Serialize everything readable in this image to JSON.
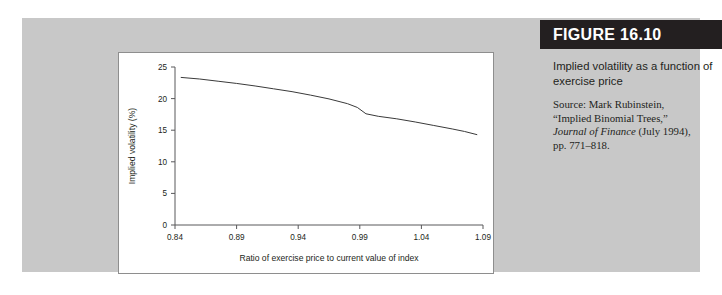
{
  "figure": {
    "header_label": "FIGURE 16.10",
    "caption_title": "Implied volatility as a function of exercise price",
    "source_line1": "Source: Mark Rubinstein,",
    "source_line2": "“Implied Binomial Trees,”",
    "source_line3_italic": "Journal of Finance",
    "source_line3_rest": " (July 1994),",
    "source_line4": "pp. 771–818."
  },
  "colors": {
    "figure_background": "#c8c8c8",
    "header_bar": "#231f20",
    "plot_background": "#ffffff",
    "plot_border": "#8e8e8e",
    "axis": "#58585a",
    "curve": "#3a3a3a"
  },
  "chart_data": {
    "type": "line",
    "title": "",
    "xlabel": "Ratio of exercise price to current value of index",
    "ylabel": "Implied volatility (%)",
    "xlim": [
      0.84,
      1.09
    ],
    "ylim": [
      0,
      25
    ],
    "xticks": [
      "0.84",
      "0.89",
      "0.94",
      "0.99",
      "1.04",
      "1.09"
    ],
    "xtick_values": [
      0.84,
      0.89,
      0.94,
      0.99,
      1.04,
      1.09
    ],
    "yticks": [
      "0",
      "5",
      "10",
      "15",
      "20",
      "25"
    ],
    "ytick_values": [
      0,
      5,
      10,
      15,
      20,
      25
    ],
    "grid": false,
    "legend": "none",
    "series": [
      {
        "name": "Implied volatility",
        "x": [
          0.845,
          0.86,
          0.875,
          0.89,
          0.905,
          0.92,
          0.935,
          0.95,
          0.965,
          0.98,
          0.988,
          0.995,
          1.005,
          1.02,
          1.035,
          1.05,
          1.065,
          1.075,
          1.085
        ],
        "y": [
          23.35,
          23.1,
          22.75,
          22.4,
          22.0,
          21.55,
          21.1,
          20.55,
          19.95,
          19.2,
          18.6,
          17.6,
          17.2,
          16.8,
          16.3,
          15.75,
          15.2,
          14.8,
          14.3
        ]
      }
    ]
  }
}
